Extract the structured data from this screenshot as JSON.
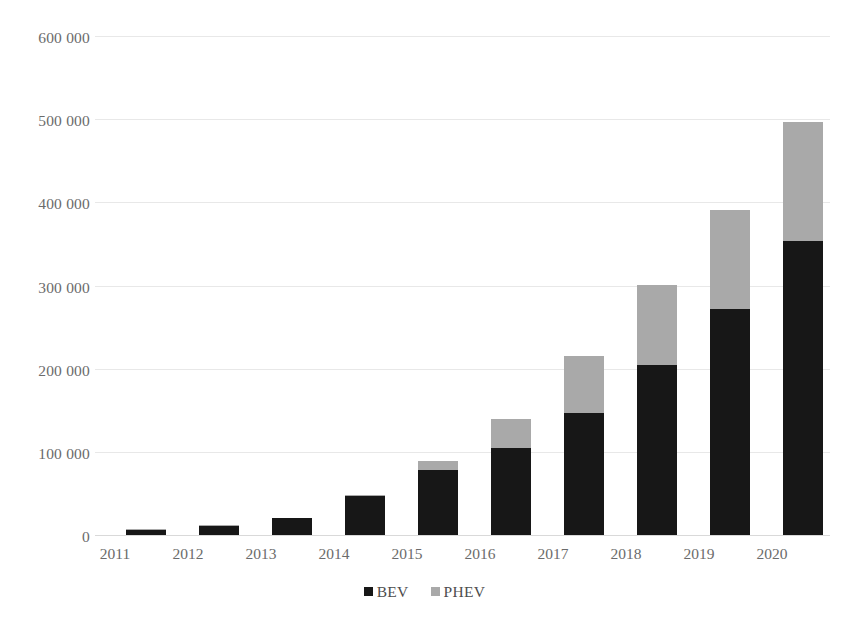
{
  "chart_data": {
    "type": "bar",
    "stacked": true,
    "title": "",
    "subtitle": "",
    "xlabel": "",
    "ylabel": "",
    "categories": [
      "2011",
      "2012",
      "2013",
      "2014",
      "2015",
      "2016",
      "2017",
      "2018",
      "2019",
      "2020"
    ],
    "series": [
      {
        "name": "BEV",
        "color": "#171717",
        "values": [
          6000,
          11000,
          20000,
          47000,
          78000,
          105000,
          147000,
          204000,
          272000,
          353000
        ]
      },
      {
        "name": "PHEV",
        "color": "#a9a9a9",
        "values": [
          1000,
          1000,
          1000,
          1000,
          11000,
          35000,
          68000,
          97000,
          119000,
          144000
        ]
      }
    ],
    "totals": [
      7000,
      12000,
      21000,
      48000,
      89000,
      140000,
      215000,
      301000,
      391000,
      497000
    ],
    "ylim": [
      0,
      600000
    ],
    "y_tick_step": 100000,
    "y_ticks": [
      600000,
      500000,
      400000,
      300000,
      200000,
      100000,
      0
    ],
    "y_tick_labels": [
      "600 000",
      "500 000",
      "400 000",
      "300 000",
      "200 000",
      "100 000",
      "0"
    ],
    "grid": true,
    "grid_axis": "y",
    "grid_color": "#e8e8e8",
    "legend_position": "bottom",
    "legend": [
      "BEV",
      "PHEV"
    ],
    "background": "#ffffff"
  },
  "legend": {
    "items": [
      {
        "label": "BEV",
        "swatch_name": "legend-swatch-bev"
      },
      {
        "label": "PHEV",
        "swatch_name": "legend-swatch-phev"
      }
    ]
  }
}
